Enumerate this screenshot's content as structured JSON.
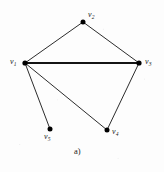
{
  "figure": {
    "caption": "a)",
    "background_color": "#fdfdfd",
    "stroke_color": "#141414",
    "vertex_color": "#000000"
  },
  "graph": {
    "type": "undirected-graph",
    "vertex_count": 5,
    "edge_count": 6,
    "vertices": [
      {
        "id": "v1",
        "label_base": "v",
        "label_sub": "1",
        "x": 25,
        "y": 63,
        "r": 2.6,
        "label_x": 10,
        "label_y": 58,
        "label_anchor": "left-of-vertex"
      },
      {
        "id": "v2",
        "label_base": "v",
        "label_sub": "2",
        "x": 83,
        "y": 22,
        "r": 2.5,
        "label_x": 88,
        "label_y": 11,
        "label_anchor": "right-above-vertex"
      },
      {
        "id": "v3",
        "label_base": "v",
        "label_sub": "3",
        "x": 139,
        "y": 63,
        "r": 2.6,
        "label_x": 145,
        "label_y": 58,
        "label_anchor": "right-of-vertex"
      },
      {
        "id": "v4",
        "label_base": "v",
        "label_sub": "4",
        "x": 107,
        "y": 130,
        "r": 2.5,
        "label_x": 112,
        "label_y": 128,
        "label_anchor": "right-of-vertex"
      },
      {
        "id": "v5",
        "label_base": "v",
        "label_sub": "5",
        "x": 50,
        "y": 129,
        "r": 2.5,
        "label_x": 44,
        "label_y": 133,
        "label_anchor": "below-vertex"
      }
    ],
    "edges": [
      {
        "from": "v1",
        "to": "v2",
        "x1": 25,
        "y1": 63,
        "x2": 83,
        "y2": 22,
        "width": 0.9
      },
      {
        "from": "v2",
        "to": "v3",
        "x1": 83,
        "y1": 22,
        "x2": 139,
        "y2": 63,
        "width": 0.9
      },
      {
        "from": "v1",
        "to": "v3",
        "x1": 25,
        "y1": 63,
        "x2": 139,
        "y2": 63,
        "width": 1.9
      },
      {
        "from": "v1",
        "to": "v5",
        "x1": 25,
        "y1": 63,
        "x2": 50,
        "y2": 129,
        "width": 0.9
      },
      {
        "from": "v1",
        "to": "v4",
        "x1": 25,
        "y1": 63,
        "x2": 107,
        "y2": 130,
        "width": 0.9
      },
      {
        "from": "v3",
        "to": "v4",
        "x1": 139,
        "y1": 63,
        "x2": 107,
        "y2": 130,
        "width": 0.9
      }
    ]
  }
}
